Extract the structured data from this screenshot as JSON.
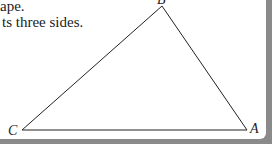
{
  "text": {
    "line1": "ape.",
    "line2": "ts three sides."
  },
  "figure": {
    "type": "triangle",
    "vertices": [
      {
        "label": "B",
        "x": 162,
        "y": 5
      },
      {
        "label": "C",
        "x": 22,
        "y": 130
      },
      {
        "label": "A",
        "x": 248,
        "y": 130
      }
    ],
    "stroke_color": "#222222"
  },
  "colors": {
    "page": "#ffffff",
    "frame": "#8a8a8a"
  }
}
